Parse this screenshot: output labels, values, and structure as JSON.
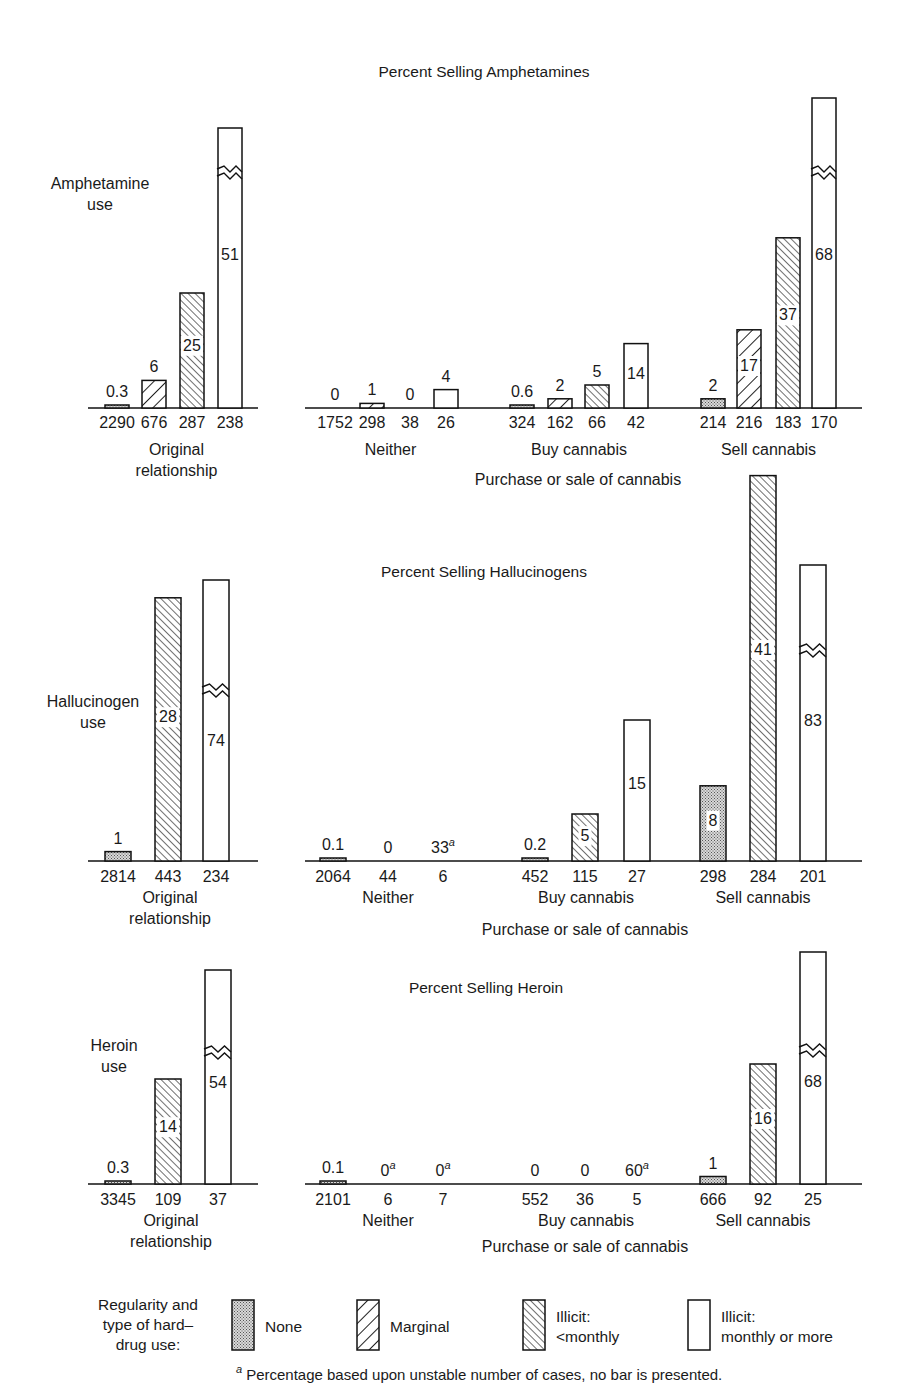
{
  "legend": {
    "title_lines": [
      "Regularity and",
      "type of hard–",
      "drug use:"
    ],
    "items": [
      {
        "key": "none",
        "lines": [
          "None"
        ]
      },
      {
        "key": "marginal",
        "lines": [
          "Marginal"
        ]
      },
      {
        "key": "lt_monthly",
        "lines": [
          "Illicit:",
          "<monthly"
        ]
      },
      {
        "key": "monthly",
        "lines": [
          "Illicit:",
          "monthly or more"
        ]
      }
    ]
  },
  "footnote": {
    "mark": "a",
    "text": "Percentage based upon unstable number of cases, no bar is presented."
  },
  "chart_data": [
    {
      "type": "bar",
      "title": "Percent Selling Amphetamines",
      "row_label": [
        "Amphetamine",
        "use"
      ],
      "xlabel": "Purchase or sale of cannabis",
      "ylabel": "Percent selling",
      "series_keys": [
        "none",
        "marginal",
        "lt_monthly",
        "monthly"
      ],
      "series_names": [
        "None",
        "Marginal",
        "Illicit: <monthly",
        "Illicit: monthly or more"
      ],
      "groups": [
        {
          "name": "Original relationship",
          "name_lines": [
            "Original",
            "relationship"
          ],
          "bars": [
            {
              "series": "none",
              "value": 0.3,
              "n": 2290
            },
            {
              "series": "marginal",
              "value": 6,
              "n": 676
            },
            {
              "series": "lt_monthly",
              "value": 25,
              "n": 287
            },
            {
              "series": "monthly",
              "value": 51,
              "n": 238,
              "broken": true
            }
          ]
        },
        {
          "name": "Neither",
          "name_lines": [
            "Neither"
          ],
          "bars": [
            {
              "series": "none",
              "value": 0,
              "n": 1752
            },
            {
              "series": "marginal",
              "value": 1,
              "n": 298
            },
            {
              "series": "lt_monthly",
              "value": 0,
              "n": 38
            },
            {
              "series": "monthly",
              "value": 4,
              "n": 26
            }
          ]
        },
        {
          "name": "Buy cannabis",
          "name_lines": [
            "Buy cannabis"
          ],
          "bars": [
            {
              "series": "none",
              "value": 0.6,
              "n": 324
            },
            {
              "series": "marginal",
              "value": 2,
              "n": 162
            },
            {
              "series": "lt_monthly",
              "value": 5,
              "n": 66
            },
            {
              "series": "monthly",
              "value": 14,
              "n": 42
            }
          ]
        },
        {
          "name": "Sell cannabis",
          "name_lines": [
            "Sell cannabis"
          ],
          "bars": [
            {
              "series": "none",
              "value": 2,
              "n": 214
            },
            {
              "series": "marginal",
              "value": 17,
              "n": 216
            },
            {
              "series": "lt_monthly",
              "value": 37,
              "n": 183
            },
            {
              "series": "monthly",
              "value": 68,
              "n": 170,
              "broken": true
            }
          ]
        }
      ]
    },
    {
      "type": "bar",
      "title": "Percent Selling Hallucinogens",
      "row_label": [
        "Hallucinogen",
        "use"
      ],
      "xlabel": "Purchase or sale of cannabis",
      "ylabel": "Percent selling",
      "series_keys": [
        "none",
        "lt_monthly",
        "monthly"
      ],
      "series_names": [
        "None",
        "Illicit: <monthly",
        "Illicit: monthly or more"
      ],
      "groups": [
        {
          "name": "Original relationship",
          "name_lines": [
            "Original",
            "relationship"
          ],
          "bars": [
            {
              "series": "none",
              "value": 1,
              "n": 2814
            },
            {
              "series": "lt_monthly",
              "value": 28,
              "n": 443
            },
            {
              "series": "monthly",
              "value": 74,
              "n": 234,
              "broken": true
            }
          ]
        },
        {
          "name": "Neither",
          "name_lines": [
            "Neither"
          ],
          "bars": [
            {
              "series": "none",
              "value": 0.1,
              "n": 2064
            },
            {
              "series": "lt_monthly",
              "value": 0,
              "n": 44
            },
            {
              "series": "monthly",
              "value": 33,
              "n": 6,
              "unstable": true
            }
          ]
        },
        {
          "name": "Buy cannabis",
          "name_lines": [
            "Buy cannabis"
          ],
          "bars": [
            {
              "series": "none",
              "value": 0.2,
              "n": 452
            },
            {
              "series": "lt_monthly",
              "value": 5,
              "n": 115
            },
            {
              "series": "monthly",
              "value": 15,
              "n": 27
            }
          ]
        },
        {
          "name": "Sell cannabis",
          "name_lines": [
            "Sell cannabis"
          ],
          "bars": [
            {
              "series": "none",
              "value": 8,
              "n": 298
            },
            {
              "series": "lt_monthly",
              "value": 41,
              "n": 284
            },
            {
              "series": "monthly",
              "value": 83,
              "n": 201,
              "broken": true
            }
          ]
        }
      ]
    },
    {
      "type": "bar",
      "title": "Percent Selling Heroin",
      "row_label": [
        "Heroin",
        "use"
      ],
      "xlabel": "Purchase or sale of cannabis",
      "ylabel": "Percent selling",
      "series_keys": [
        "none",
        "lt_monthly",
        "monthly"
      ],
      "series_names": [
        "None",
        "Illicit: <monthly",
        "Illicit: monthly or more"
      ],
      "groups": [
        {
          "name": "Original relationship",
          "name_lines": [
            "Original",
            "relationship"
          ],
          "bars": [
            {
              "series": "none",
              "value": 0.3,
              "n": 3345
            },
            {
              "series": "lt_monthly",
              "value": 14,
              "n": 109
            },
            {
              "series": "monthly",
              "value": 54,
              "n": 37,
              "broken": true
            }
          ]
        },
        {
          "name": "Neither",
          "name_lines": [
            "Neither"
          ],
          "bars": [
            {
              "series": "none",
              "value": 0.1,
              "n": 2101
            },
            {
              "series": "lt_monthly",
              "value": 0,
              "n": 6,
              "unstable": true
            },
            {
              "series": "monthly",
              "value": 0,
              "n": 7,
              "unstable": true
            }
          ]
        },
        {
          "name": "Buy cannabis",
          "name_lines": [
            "Buy cannabis"
          ],
          "bars": [
            {
              "series": "none",
              "value": 0,
              "n": 552
            },
            {
              "series": "lt_monthly",
              "value": 0,
              "n": 36
            },
            {
              "series": "monthly",
              "value": 60,
              "n": 5,
              "unstable": true
            }
          ]
        },
        {
          "name": "Sell cannabis",
          "name_lines": [
            "Sell cannabis"
          ],
          "bars": [
            {
              "series": "none",
              "value": 1,
              "n": 666
            },
            {
              "series": "lt_monthly",
              "value": 16,
              "n": 92
            },
            {
              "series": "monthly",
              "value": 68,
              "n": 25,
              "broken": true
            }
          ]
        }
      ]
    }
  ],
  "layout": {
    "panels": [
      {
        "title_xy": [
          484,
          77
        ],
        "row_label_xy": [
          100,
          189
        ],
        "baseline": 408,
        "scale": 4.6,
        "broken_top": 128,
        "broken_zig": 172,
        "left_axis": [
          88,
          258
        ],
        "right_axis": [
          305,
          862
        ],
        "left_x": [
          117,
          154,
          192,
          230
        ],
        "bar_w": 24,
        "group_x": [
          [
            335,
            372,
            410,
            446
          ],
          [
            522,
            560,
            597,
            636
          ],
          [
            713,
            749,
            788,
            824
          ]
        ],
        "broken_tops": {
          "0-3": 128,
          "3-3": 98
        },
        "broken_zigs": {
          "0-3": 172,
          "3-3": 172
        },
        "count_y": 428,
        "group_label_y": 455,
        "orig_lines_y": [
          455,
          476
        ],
        "xlabel_y": 485
      },
      {
        "title_xy": [
          484,
          577
        ],
        "row_label_xy": [
          93,
          707
        ],
        "baseline": 861,
        "scale": 9.4,
        "left_axis": [
          88,
          258
        ],
        "right_axis": [
          305,
          862
        ],
        "left_x": [
          118,
          168,
          216
        ],
        "bar_w": 26,
        "group_x": [
          [
            333,
            388,
            443
          ],
          [
            535,
            585,
            637
          ],
          [
            713,
            763,
            813
          ]
        ],
        "broken_tops": {
          "0-2": 580,
          "3-2": 565
        },
        "broken_zigs": {
          "0-2": 690,
          "3-2": 650
        },
        "count_y": 882,
        "group_label_y": 903,
        "orig_lines_y": [
          903,
          924
        ],
        "xlabel_y": 935
      },
      {
        "title_xy": [
          486,
          993
        ],
        "row_label_xy": [
          114,
          1051
        ],
        "baseline": 1184,
        "scale": 7.5,
        "left_axis": [
          88,
          258
        ],
        "right_axis": [
          305,
          862
        ],
        "left_x": [
          118,
          168,
          218
        ],
        "bar_w": 26,
        "group_x": [
          [
            333,
            388,
            443
          ],
          [
            535,
            585,
            637
          ],
          [
            713,
            763,
            813
          ]
        ],
        "broken_tops": {
          "0-2": 970,
          "3-2": 952
        },
        "broken_zigs": {
          "0-2": 1052,
          "3-2": 1050
        },
        "count_y": 1205,
        "group_label_y": 1226,
        "orig_lines_y": [
          1226,
          1247
        ],
        "xlabel_y": 1252
      }
    ]
  }
}
